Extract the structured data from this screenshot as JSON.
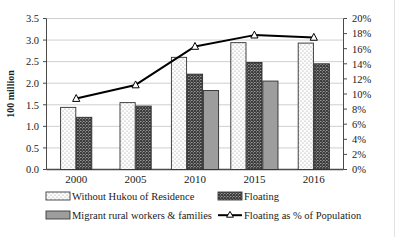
{
  "chart_data": {
    "type": "bar",
    "title": "",
    "xlabel": "",
    "ylabel": "100 million",
    "categories": [
      "2000",
      "2005",
      "2010",
      "2015",
      "2016"
    ],
    "ylim": [
      0,
      3.5
    ],
    "y2lim": [
      0,
      20
    ],
    "y_ticks": [
      "0.0",
      "0.5",
      "1.0",
      "1.5",
      "2.0",
      "2.5",
      "3.0",
      "3.5"
    ],
    "y2_ticks": [
      "0%",
      "2%",
      "4%",
      "6%",
      "8%",
      "10%",
      "12%",
      "14%",
      "16%",
      "18%",
      "20%"
    ],
    "y2label": "",
    "grid": true,
    "legend_position": "bottom",
    "series": [
      {
        "name": "Without  Hukou of Residence",
        "type": "bar",
        "axis": "left",
        "pattern": "light-dots",
        "values": [
          1.44,
          1.55,
          2.6,
          2.94,
          2.93
        ]
      },
      {
        "name": "Floating",
        "type": "bar",
        "axis": "left",
        "pattern": "cross-hatch",
        "values": [
          1.21,
          1.47,
          2.21,
          2.48,
          2.45
        ]
      },
      {
        "name": "Migrant rural workers & families",
        "type": "bar",
        "axis": "left",
        "pattern": "solid-gray",
        "values": [
          null,
          null,
          1.83,
          2.05,
          null
        ]
      },
      {
        "name": "Floating as % of Population",
        "type": "line",
        "axis": "right",
        "marker": "open-triangle",
        "values": [
          9.4,
          11.2,
          16.3,
          17.8,
          17.5
        ]
      }
    ]
  },
  "legend": {
    "items": [
      {
        "label": "Without  Hukou of Residence",
        "swatch": "light-dots"
      },
      {
        "label": "Floating",
        "swatch": "cross-hatch"
      },
      {
        "label": "Migrant rural workers & families",
        "swatch": "solid-gray"
      },
      {
        "label": "Floating as % of Population",
        "swatch": "line-marker"
      }
    ]
  },
  "colors": {
    "axis": "#333333",
    "grid": "#c9c9c9",
    "line": "#000000",
    "bar_light": "#f7f7f7",
    "bar_mid": "#8c8c8c",
    "bar_solid": "#9a9a9a",
    "text": "#1a1a1a"
  }
}
